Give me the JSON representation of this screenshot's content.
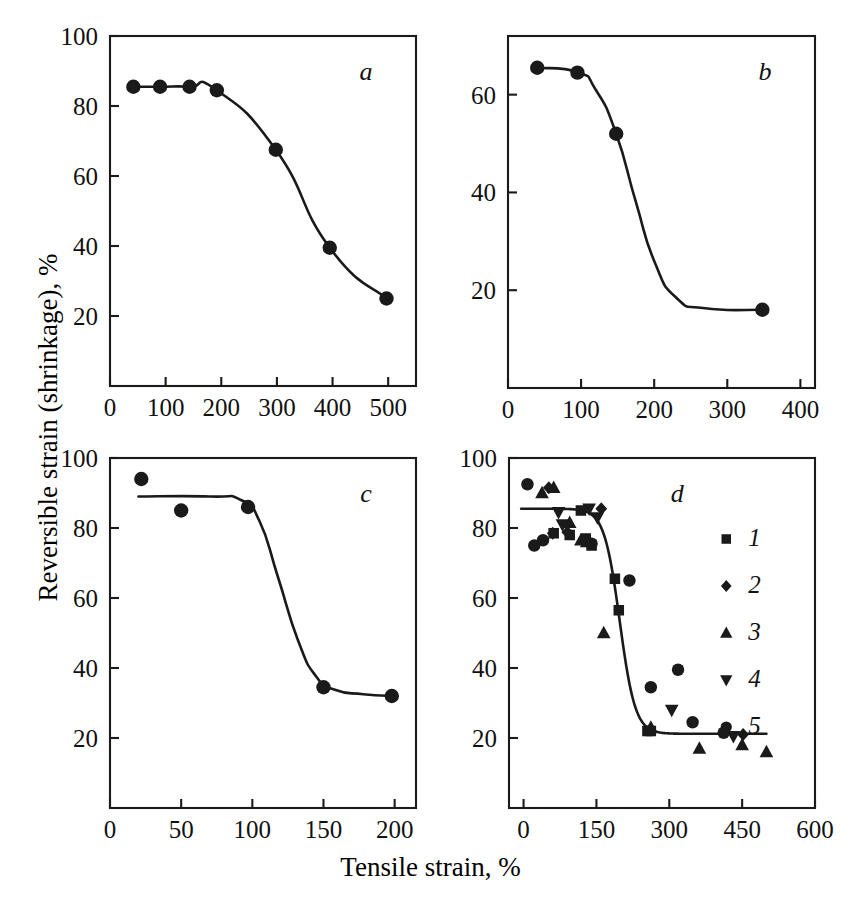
{
  "figure": {
    "xlabel": "Tensile strain, %",
    "ylabel": "Reversible strain (shrinkage), %",
    "background": "#ffffff",
    "ink": "#1a1a1a"
  },
  "chart_data": [
    {
      "type": "scatter",
      "panel": "a",
      "title": "a",
      "xlabel": "Tensile strain, %",
      "ylabel": "Reversible strain (shrinkage), %",
      "xlim": [
        0,
        550
      ],
      "ylim": [
        0,
        100
      ],
      "xticks": [
        0,
        100,
        200,
        300,
        400,
        500
      ],
      "xticklabels": [
        "0",
        "100",
        "200",
        "300",
        "400",
        "500"
      ],
      "yticks": [
        20,
        40,
        60,
        80,
        100
      ],
      "yticklabels": [
        "20",
        "40",
        "60",
        "80",
        "100"
      ],
      "grid": false,
      "legend": "none",
      "marker": "circle",
      "series": [
        {
          "name": "a",
          "x": [
            42,
            90,
            143,
            192,
            298,
            395,
            497
          ],
          "values": [
            85.5,
            85.5,
            85.5,
            84.5,
            67.5,
            39.5,
            25.0
          ]
        }
      ]
    },
    {
      "type": "scatter",
      "panel": "b",
      "title": "b",
      "xlabel": "Tensile strain, %",
      "ylabel": "Reversible strain (shrinkage), %",
      "xlim": [
        0,
        420
      ],
      "ylim": [
        0,
        72
      ],
      "xticks": [
        0,
        100,
        200,
        300,
        400
      ],
      "xticklabels": [
        "0",
        "100",
        "200",
        "300",
        "400"
      ],
      "yticks": [
        20,
        40,
        60
      ],
      "yticklabels": [
        "20",
        "40",
        "60"
      ],
      "grid": false,
      "legend": "none",
      "marker": "circle",
      "series": [
        {
          "name": "b",
          "x": [
            40,
            95,
            148,
            348
          ],
          "values": [
            65.5,
            64.5,
            52.0,
            16.0
          ]
        }
      ]
    },
    {
      "type": "scatter",
      "panel": "c",
      "title": "c",
      "xlabel": "Tensile strain, %",
      "ylabel": "Reversible strain (shrinkage), %",
      "xlim": [
        0,
        215
      ],
      "ylim": [
        0,
        100
      ],
      "xticks": [
        0,
        50,
        100,
        150,
        200
      ],
      "xticklabels": [
        "0",
        "50",
        "100",
        "150",
        "200"
      ],
      "yticks": [
        20,
        40,
        60,
        80,
        100
      ],
      "yticklabels": [
        "20",
        "40",
        "60",
        "80",
        "100"
      ],
      "grid": false,
      "legend": "none",
      "marker": "circle",
      "series": [
        {
          "name": "c",
          "x": [
            22,
            50,
            97,
            150,
            198
          ],
          "values": [
            94.0,
            85.0,
            86.0,
            34.5,
            32.0
          ]
        }
      ]
    },
    {
      "type": "scatter",
      "panel": "d",
      "title": "d",
      "xlabel": "Tensile strain, %",
      "ylabel": "Reversible strain (shrinkage), %",
      "xlim": [
        -30,
        600
      ],
      "ylim": [
        0,
        100
      ],
      "xticks": [
        0,
        150,
        300,
        450,
        600
      ],
      "xticklabels": [
        "0",
        "150",
        "300",
        "450",
        "600"
      ],
      "yticks": [
        20,
        40,
        60,
        80,
        100
      ],
      "yticklabels": [
        "20",
        "40",
        "60",
        "80",
        "100"
      ],
      "grid": false,
      "legend": "inside-right",
      "legend_entries": [
        {
          "label": "1",
          "marker": "square"
        },
        {
          "label": "2",
          "marker": "diamond"
        },
        {
          "label": "3",
          "marker": "triangle-up"
        },
        {
          "label": "4",
          "marker": "triangle-down"
        },
        {
          "label": "5",
          "marker": "circle"
        }
      ],
      "series": [
        {
          "name": "1",
          "marker": "square",
          "x": [
            62,
            95,
            118,
            128,
            140,
            188,
            196,
            255,
            262
          ],
          "values": [
            78.5,
            78.0,
            85.0,
            77.0,
            75.0,
            65.5,
            56.5,
            22.0,
            22.0
          ]
        },
        {
          "name": "2",
          "marker": "diamond",
          "x": [
            52,
            60,
            90,
            160,
            452
          ],
          "values": [
            91.5,
            78.5,
            78.8,
            85.5,
            21.0
          ]
        },
        {
          "name": "3",
          "marker": "triangle-up",
          "x": [
            38,
            62,
            95,
            118,
            130,
            165,
            262,
            362,
            450,
            500
          ],
          "values": [
            90.0,
            91.5,
            81.5,
            76.5,
            76.0,
            50.0,
            23.0,
            17.0,
            18.0,
            16.0
          ]
        },
        {
          "name": "4",
          "marker": "triangle-down",
          "x": [
            72,
            80,
            135,
            152,
            305,
            432
          ],
          "values": [
            84.5,
            81.0,
            85.5,
            83.0,
            28.0,
            20.5
          ]
        },
        {
          "name": "5",
          "marker": "circle",
          "x": [
            8,
            22,
            40,
            140,
            218,
            262,
            318,
            348,
            412
          ],
          "values": [
            92.5,
            75.0,
            76.5,
            75.5,
            65.0,
            34.5,
            39.5,
            24.5,
            21.5
          ]
        }
      ]
    }
  ]
}
